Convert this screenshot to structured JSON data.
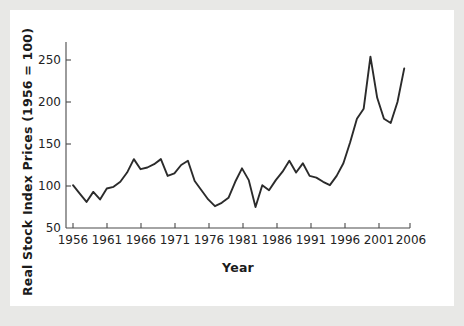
{
  "figure": {
    "background_color": "#ffffff",
    "page_background_color": "#e8e8e6",
    "line_color": "#2b2b2b",
    "axis_color": "#4a4a4a"
  },
  "chart_data": {
    "type": "line",
    "title": "",
    "xlabel": "Year",
    "ylabel": "Real Stock Index Prices (1956 = 100)",
    "xlim": [
      1955,
      2006
    ],
    "ylim": [
      50,
      270
    ],
    "xticks": [
      1956,
      1961,
      1966,
      1971,
      1976,
      1981,
      1986,
      1991,
      1996,
      2001,
      2006
    ],
    "xtick_labels": [
      "1956",
      "1961",
      "1966",
      "1971",
      "1976",
      "1981",
      "1986",
      "1991",
      "1996",
      "2001",
      "2006"
    ],
    "yticks": [
      50,
      100,
      150,
      200,
      250
    ],
    "ytick_labels": [
      "50",
      "100",
      "150",
      "200",
      "250"
    ],
    "grid": false,
    "legend": false,
    "legend_position": "none",
    "series": [
      {
        "name": "Real Stock Index Prices",
        "x": [
          1956,
          1957,
          1958,
          1959,
          1960,
          1961,
          1962,
          1963,
          1964,
          1965,
          1966,
          1967,
          1968,
          1969,
          1970,
          1971,
          1972,
          1973,
          1974,
          1975,
          1976,
          1977,
          1978,
          1979,
          1980,
          1981,
          1982,
          1983,
          1984,
          1985,
          1986,
          1987,
          1988,
          1989,
          1990,
          1991,
          1992,
          1993,
          1994,
          1995,
          1996,
          1997,
          1998,
          1999,
          2000,
          2001,
          2002,
          2003,
          2004,
          2005
        ],
        "y": [
          101,
          91,
          81,
          93,
          84,
          97,
          99,
          105,
          116,
          132,
          120,
          122,
          126,
          132,
          112,
          115,
          125,
          130,
          106,
          95,
          84,
          76,
          80,
          86,
          105,
          121,
          107,
          75,
          101,
          95,
          107,
          117,
          130,
          116,
          127,
          112,
          110,
          105,
          101,
          112,
          127,
          152,
          180,
          192,
          254,
          205,
          180,
          175,
          200,
          240
        ],
        "color": "#2b2b2b",
        "linewidth": 1.9
      }
    ],
    "annotations": []
  }
}
